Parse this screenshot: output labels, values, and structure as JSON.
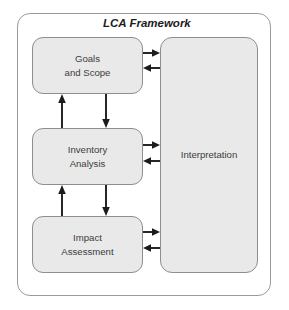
{
  "diagram": {
    "title": "LCA Framework",
    "stages": [
      {
        "id": "goals",
        "line1": "Goals",
        "line2": "and Scope"
      },
      {
        "id": "inventory",
        "line1": "Inventory",
        "line2": "Analysis"
      },
      {
        "id": "impact",
        "line1": "Impact",
        "line2": "Assessment"
      }
    ],
    "interpretation": {
      "label": "Interpretation"
    },
    "connectors": [
      {
        "name": "goals-to-interpretation",
        "from": "Goals and Scope",
        "to": "Interpretation",
        "direction": "right"
      },
      {
        "name": "interpretation-to-goals",
        "from": "Interpretation",
        "to": "Goals and Scope",
        "direction": "left"
      },
      {
        "name": "inventory-to-interpretation",
        "from": "Inventory Analysis",
        "to": "Interpretation",
        "direction": "right"
      },
      {
        "name": "interpretation-to-inventory",
        "from": "Interpretation",
        "to": "Inventory Analysis",
        "direction": "left"
      },
      {
        "name": "impact-to-interpretation",
        "from": "Impact Assessment",
        "to": "Interpretation",
        "direction": "right"
      },
      {
        "name": "interpretation-to-impact",
        "from": "Interpretation",
        "to": "Impact Assessment",
        "direction": "left"
      },
      {
        "name": "inventory-to-goals",
        "from": "Inventory Analysis",
        "to": "Goals and Scope",
        "direction": "up"
      },
      {
        "name": "goals-to-inventory",
        "from": "Goals and Scope",
        "to": "Inventory Analysis",
        "direction": "down"
      },
      {
        "name": "impact-to-inventory",
        "from": "Impact Assessment",
        "to": "Inventory Analysis",
        "direction": "up"
      },
      {
        "name": "inventory-to-impact",
        "from": "Inventory Analysis",
        "to": "Impact Assessment",
        "direction": "down"
      }
    ],
    "colors": {
      "box_fill": "#e9e9e9",
      "box_border": "#8e8e8e",
      "frame_border": "#9a9a9a",
      "arrow": "#1c1c1c",
      "text": "#3c3c3c",
      "background": "#ffffff"
    }
  }
}
